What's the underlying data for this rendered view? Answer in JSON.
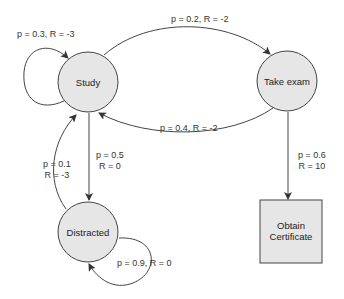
{
  "diagram": {
    "type": "markov-decision-process",
    "colors": {
      "node_fill": "#e6e6e6",
      "stroke": "#444444",
      "text": "#333333",
      "background": "#ffffff"
    },
    "nodes": [
      {
        "id": "study",
        "label": "Study",
        "shape": "circle"
      },
      {
        "id": "take_exam",
        "label": "Take exam",
        "shape": "circle"
      },
      {
        "id": "distracted",
        "label": "Distracted",
        "shape": "circle"
      },
      {
        "id": "obtain_certificate",
        "label_line1": "Obtain",
        "label_line2": "Certificate",
        "shape": "square"
      }
    ],
    "edges": [
      {
        "from": "study",
        "to": "study",
        "label": "p = 0.3, R = -3"
      },
      {
        "from": "study",
        "to": "take_exam",
        "label": "p = 0.2, R = -2"
      },
      {
        "from": "take_exam",
        "to": "study",
        "label": "p = 0.4, R = -2"
      },
      {
        "from": "study",
        "to": "distracted",
        "label_line1": "p = 0.5",
        "label_line2": "R = 0"
      },
      {
        "from": "distracted",
        "to": "study",
        "label_line1": "p = 0.1",
        "label_line2": "R = -3"
      },
      {
        "from": "distracted",
        "to": "distracted",
        "label": "p = 0.9, R = 0"
      },
      {
        "from": "take_exam",
        "to": "obtain_certificate",
        "label_line1": "p = 0.6",
        "label_line2": "R = 10"
      }
    ]
  }
}
